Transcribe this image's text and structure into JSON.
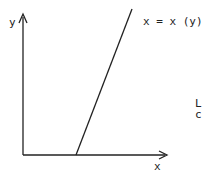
{
  "diagram": {
    "y_axis_label": "y",
    "x_axis_label": "x",
    "curve_label": "x = x (y)",
    "cutoff_text": [
      "L",
      "c"
    ],
    "line_color": "#222222"
  }
}
